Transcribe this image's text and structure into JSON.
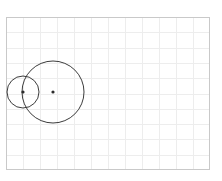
{
  "canvas": {
    "width": 222,
    "height": 181,
    "background_color": "#ffffff",
    "title": "Two overlapping circles on a light grid"
  },
  "grid_panel": {
    "x": 6,
    "y": 17,
    "width": 204,
    "height": 153,
    "border_color": "#c9c9c9",
    "border_width": 1,
    "fill_color": "#ffffff",
    "grid_line_color": "#ededed",
    "grid_line_width": 1,
    "columns": 12,
    "rows": 10,
    "cell_width": 17,
    "cell_height": 15.3
  },
  "chart_data": {
    "type": "scatter",
    "title": "",
    "xlabel": "",
    "ylabel": "",
    "grid": true,
    "legend": "none",
    "xlim": [
      6,
      210
    ],
    "ylim": [
      17,
      170
    ],
    "shapes": [
      {
        "name": "small-circle",
        "kind": "circle",
        "cx": 23,
        "cy": 92,
        "r": 16,
        "stroke": "#3c3c3c",
        "stroke_width": 1,
        "fill": "none",
        "center_marker": true
      },
      {
        "name": "large-circle",
        "kind": "circle",
        "cx": 53,
        "cy": 92,
        "r": 31,
        "stroke": "#3c3c3c",
        "stroke_width": 1,
        "fill": "none",
        "center_marker": true
      }
    ],
    "center_markers": [
      {
        "name": "small-circle-center",
        "cx": 23,
        "cy": 92,
        "r": 1.6,
        "fill": "#2b2b2b"
      },
      {
        "name": "large-circle-center",
        "cx": 53,
        "cy": 92,
        "r": 1.6,
        "fill": "#2b2b2b"
      }
    ]
  }
}
